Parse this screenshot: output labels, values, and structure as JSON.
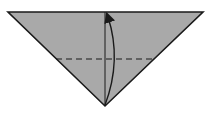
{
  "diagram": {
    "type": "origami-fold-step",
    "shape": "triangle",
    "colors": {
      "paper_fill": "#a9a9a9",
      "outline": "#1a1a1a",
      "background": "#ffffff"
    },
    "elements": [
      {
        "kind": "triangle-paper",
        "description": "inverted triangle of folded paper"
      },
      {
        "kind": "center-crease",
        "description": "vertical solid crease line down the middle"
      },
      {
        "kind": "valley-fold-line",
        "description": "horizontal dashed fold line"
      },
      {
        "kind": "fold-arrow",
        "description": "curved arrow from bottom point up to top edge"
      }
    ]
  }
}
